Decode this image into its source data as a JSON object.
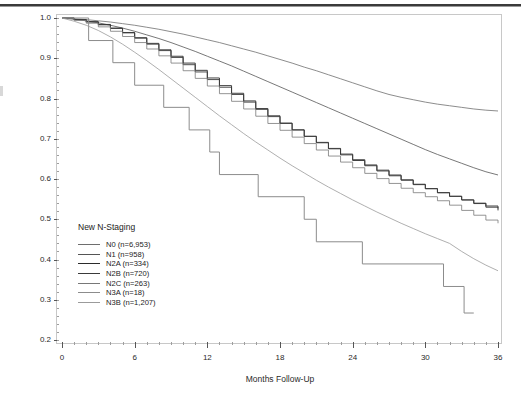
{
  "figure": {
    "background": "#ffffff",
    "frame_color": "#c8c8c8"
  },
  "chart_data": {
    "type": "line",
    "title": "",
    "subtitle": "",
    "xlabel": "Months Follow-Up",
    "ylabel": "Survival Probability",
    "xlim": [
      0,
      36
    ],
    "ylim": [
      0.2,
      1.0
    ],
    "xticks": [
      0,
      6,
      12,
      18,
      24,
      30,
      36
    ],
    "xtick_labels": [
      "0",
      "6",
      "12",
      "18",
      "24",
      "30",
      "36"
    ],
    "xminor_step": 1,
    "yticks": [
      0.2,
      0.3,
      0.4,
      0.5,
      0.6,
      0.7,
      0.8,
      0.9,
      1.0
    ],
    "ytick_labels": [
      "0.2",
      "0.3",
      "0.4",
      "0.5",
      "0.6",
      "0.7",
      "0.8",
      "0.9",
      "1.0"
    ],
    "grid": false,
    "legend_title": "New N-Staging",
    "legend_position": "inside-lower-left",
    "series": [
      {
        "name": "N0 (n=6,953)",
        "label": "N0 (n=6,953)",
        "group": "N0",
        "n": "6,953",
        "color": "#6e6e6e",
        "width": 0.8,
        "step": false,
        "x": [
          0,
          1,
          2,
          3,
          4,
          5,
          6,
          7,
          8,
          9,
          10,
          11,
          12,
          13,
          14,
          15,
          16,
          17,
          18,
          19,
          20,
          21,
          22,
          23,
          24,
          25,
          26,
          27,
          28,
          29,
          30,
          31,
          32,
          33,
          34,
          35,
          36
        ],
        "y": [
          1.0,
          0.998,
          0.996,
          0.993,
          0.99,
          0.986,
          0.982,
          0.977,
          0.972,
          0.966,
          0.96,
          0.953,
          0.946,
          0.939,
          0.931,
          0.923,
          0.915,
          0.906,
          0.897,
          0.888,
          0.878,
          0.869,
          0.859,
          0.849,
          0.839,
          0.829,
          0.819,
          0.81,
          0.803,
          0.797,
          0.791,
          0.786,
          0.782,
          0.778,
          0.774,
          0.771,
          0.769
        ]
      },
      {
        "name": "N1 (n=958)",
        "label": "N1 (n=958)",
        "group": "N1",
        "n": "958",
        "color": "#555555",
        "width": 0.8,
        "step": false,
        "x": [
          0,
          1,
          2,
          3,
          4,
          5,
          6,
          7,
          8,
          9,
          10,
          11,
          12,
          13,
          14,
          15,
          16,
          17,
          18,
          19,
          20,
          21,
          22,
          23,
          24,
          25,
          26,
          27,
          28,
          29,
          30,
          31,
          32,
          33,
          34,
          35,
          36
        ],
        "y": [
          1.0,
          0.997,
          0.993,
          0.988,
          0.982,
          0.975,
          0.967,
          0.958,
          0.949,
          0.939,
          0.928,
          0.917,
          0.905,
          0.893,
          0.881,
          0.868,
          0.855,
          0.842,
          0.829,
          0.816,
          0.803,
          0.79,
          0.777,
          0.764,
          0.751,
          0.738,
          0.725,
          0.712,
          0.699,
          0.686,
          0.673,
          0.661,
          0.65,
          0.639,
          0.628,
          0.618,
          0.61
        ]
      },
      {
        "name": "N2A (n=334)",
        "label": "N2A (n=334)",
        "group": "N2A",
        "n": "334",
        "color": "#2b2b2b",
        "width": 0.9,
        "step": true,
        "x": [
          0,
          1,
          2,
          3,
          4,
          5,
          6,
          7,
          8,
          9,
          10,
          11,
          12,
          13,
          14,
          15,
          16,
          17,
          18,
          19,
          20,
          21,
          22,
          23,
          24,
          25,
          26,
          27,
          28,
          29,
          30,
          31,
          32,
          33,
          34,
          35,
          36
        ],
        "y": [
          1.0,
          0.996,
          0.991,
          0.984,
          0.975,
          0.964,
          0.951,
          0.937,
          0.921,
          0.905,
          0.888,
          0.87,
          0.851,
          0.832,
          0.813,
          0.794,
          0.775,
          0.757,
          0.739,
          0.722,
          0.706,
          0.69,
          0.675,
          0.66,
          0.646,
          0.633,
          0.62,
          0.608,
          0.597,
          0.586,
          0.576,
          0.566,
          0.557,
          0.548,
          0.539,
          0.53,
          0.522
        ]
      },
      {
        "name": "N2B (n=720)",
        "label": "N2B (n=720)",
        "group": "N2B",
        "n": "720",
        "color": "#3a3a3a",
        "width": 0.9,
        "step": true,
        "x": [
          0,
          1,
          2,
          3,
          4,
          5,
          6,
          7,
          8,
          9,
          10,
          11,
          12,
          13,
          14,
          15,
          16,
          17,
          18,
          19,
          20,
          21,
          22,
          23,
          24,
          25,
          26,
          27,
          28,
          29,
          30,
          31,
          32,
          33,
          34,
          35,
          36
        ],
        "y": [
          1.0,
          0.996,
          0.99,
          0.983,
          0.974,
          0.963,
          0.95,
          0.935,
          0.919,
          0.902,
          0.884,
          0.866,
          0.847,
          0.828,
          0.81,
          0.791,
          0.773,
          0.755,
          0.738,
          0.722,
          0.706,
          0.691,
          0.676,
          0.662,
          0.648,
          0.635,
          0.622,
          0.61,
          0.598,
          0.587,
          0.576,
          0.566,
          0.557,
          0.548,
          0.54,
          0.533,
          0.527
        ]
      },
      {
        "name": "N2C (n=263)",
        "label": "N2C (n=263)",
        "group": "N2C",
        "n": "263",
        "color": "#787878",
        "width": 0.8,
        "step": true,
        "x": [
          0,
          1,
          2,
          3,
          4,
          5,
          6,
          7,
          8,
          9,
          10,
          11,
          12,
          13,
          14,
          15,
          16,
          17,
          18,
          19,
          20,
          21,
          22,
          23,
          24,
          25,
          26,
          27,
          28,
          29,
          30,
          31,
          32,
          33,
          34,
          35,
          36
        ],
        "y": [
          1.0,
          0.994,
          0.987,
          0.978,
          0.967,
          0.954,
          0.939,
          0.923,
          0.906,
          0.888,
          0.869,
          0.85,
          0.831,
          0.812,
          0.793,
          0.774,
          0.756,
          0.738,
          0.721,
          0.704,
          0.688,
          0.672,
          0.657,
          0.642,
          0.628,
          0.614,
          0.601,
          0.589,
          0.577,
          0.566,
          0.556,
          0.546,
          0.535,
          0.522,
          0.51,
          0.498,
          0.49
        ]
      },
      {
        "name": "N3A (n=18)",
        "label": "N3A (n=18)",
        "group": "N3A",
        "n": "18",
        "color": "#8c8c8c",
        "width": 1.0,
        "step": true,
        "x": [
          0,
          2.2,
          2.2,
          4.2,
          4.2,
          6.0,
          6.0,
          8.4,
          8.4,
          10.5,
          10.5,
          12.2,
          12.2,
          13.0,
          13.0,
          16.2,
          16.2,
          20.0,
          20.0,
          21.0,
          21.0,
          24.8,
          24.8,
          27.0,
          27.0,
          31.5,
          31.5,
          33.2,
          33.2,
          34.0
        ],
        "y": [
          1.0,
          1.0,
          0.944,
          0.944,
          0.889,
          0.889,
          0.833,
          0.833,
          0.778,
          0.778,
          0.722,
          0.722,
          0.667,
          0.667,
          0.611,
          0.611,
          0.556,
          0.556,
          0.5,
          0.5,
          0.444,
          0.444,
          0.389,
          0.389,
          0.389,
          0.389,
          0.333,
          0.333,
          0.267,
          0.267
        ]
      },
      {
        "name": "N3B (n=1,207)",
        "label": "N3B (n=1,207)",
        "group": "N3B",
        "n": "1,207",
        "color": "#9b9b9b",
        "width": 0.8,
        "step": false,
        "x": [
          0,
          1,
          2,
          3,
          4,
          5,
          6,
          7,
          8,
          9,
          10,
          11,
          12,
          13,
          14,
          15,
          16,
          17,
          18,
          19,
          20,
          21,
          22,
          23,
          24,
          25,
          26,
          27,
          28,
          29,
          30,
          31,
          32,
          33,
          34,
          35,
          36
        ],
        "y": [
          1.0,
          0.992,
          0.982,
          0.969,
          0.953,
          0.935,
          0.915,
          0.894,
          0.872,
          0.849,
          0.826,
          0.803,
          0.78,
          0.757,
          0.735,
          0.713,
          0.692,
          0.672,
          0.652,
          0.633,
          0.615,
          0.597,
          0.58,
          0.564,
          0.548,
          0.533,
          0.518,
          0.504,
          0.49,
          0.477,
          0.464,
          0.452,
          0.44,
          0.42,
          0.402,
          0.386,
          0.372
        ]
      }
    ]
  }
}
